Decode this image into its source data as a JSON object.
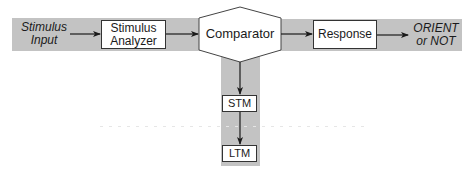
{
  "diagram": {
    "type": "flowchart",
    "colors": {
      "band": "#c3c3c3",
      "box_fill": "#ffffff",
      "stroke": "#333333",
      "arrow": "#1a1a1a"
    },
    "input": {
      "line1": "Stimulus",
      "line2": "Input"
    },
    "nodes": {
      "stimulus_analyzer": {
        "line1": "Stimulus",
        "line2": "Analyzer"
      },
      "comparator": {
        "label": "Comparator"
      },
      "response": {
        "label": "Response"
      },
      "stm": {
        "label": "STM"
      },
      "ltm": {
        "label": "LTM"
      }
    },
    "output": {
      "line1": "ORIENT",
      "line2": "or NOT"
    },
    "edges": [
      {
        "from": "Stimulus Input",
        "to": "Stimulus Analyzer"
      },
      {
        "from": "Stimulus Analyzer",
        "to": "Comparator"
      },
      {
        "from": "Comparator",
        "to": "Response"
      },
      {
        "from": "Response",
        "to": "ORIENT or NOT"
      },
      {
        "from": "Comparator",
        "to": "STM"
      },
      {
        "from": "STM",
        "to": "LTM"
      }
    ]
  }
}
